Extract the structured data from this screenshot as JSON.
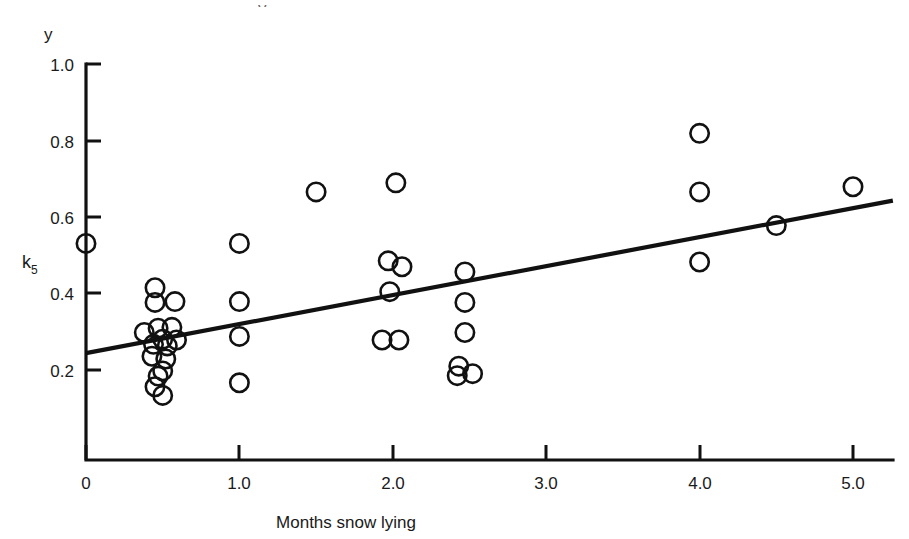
{
  "figure": {
    "background_color": "#ffffff",
    "ink_color": "#111111",
    "partial_glyph_top": "y"
  },
  "chart_data": {
    "type": "scatter",
    "title": "",
    "xlabel": "Months snow lying",
    "ylabel": "y",
    "y_axis_secondary_label": "k",
    "y_axis_secondary_subscript": "5",
    "y_axis_secondary_value": 0.5,
    "xlim": [
      0,
      5.35
    ],
    "ylim": [
      0,
      1.0
    ],
    "grid": false,
    "legend": null,
    "xticks": [
      0,
      1.0,
      2.0,
      3.0,
      4.0,
      5.0
    ],
    "xtick_labels": [
      "0",
      "1.0",
      "2.0",
      "3.0",
      "4.0",
      "5.0"
    ],
    "yticks": [
      0.2,
      0.4,
      0.6,
      0.8,
      1.0
    ],
    "ytick_labels": [
      "0.2",
      "0.4",
      "0.6",
      "0.8",
      "1.0"
    ],
    "marker": "open-circle",
    "points": [
      {
        "x": 0.0,
        "y": 0.547
      },
      {
        "x": 0.45,
        "y": 0.435
      },
      {
        "x": 0.45,
        "y": 0.398
      },
      {
        "x": 0.58,
        "y": 0.4
      },
      {
        "x": 0.38,
        "y": 0.322
      },
      {
        "x": 0.47,
        "y": 0.333
      },
      {
        "x": 0.56,
        "y": 0.335
      },
      {
        "x": 0.5,
        "y": 0.305
      },
      {
        "x": 0.59,
        "y": 0.303
      },
      {
        "x": 0.44,
        "y": 0.292
      },
      {
        "x": 0.53,
        "y": 0.288
      },
      {
        "x": 0.43,
        "y": 0.262
      },
      {
        "x": 0.52,
        "y": 0.255
      },
      {
        "x": 0.5,
        "y": 0.225
      },
      {
        "x": 0.47,
        "y": 0.212
      },
      {
        "x": 0.45,
        "y": 0.185
      },
      {
        "x": 0.5,
        "y": 0.163
      },
      {
        "x": 1.0,
        "y": 0.547
      },
      {
        "x": 1.0,
        "y": 0.4
      },
      {
        "x": 1.0,
        "y": 0.312
      },
      {
        "x": 1.0,
        "y": 0.195
      },
      {
        "x": 1.5,
        "y": 0.677
      },
      {
        "x": 2.02,
        "y": 0.7
      },
      {
        "x": 1.97,
        "y": 0.503
      },
      {
        "x": 2.06,
        "y": 0.488
      },
      {
        "x": 1.98,
        "y": 0.425
      },
      {
        "x": 1.93,
        "y": 0.303
      },
      {
        "x": 2.04,
        "y": 0.303
      },
      {
        "x": 2.47,
        "y": 0.475
      },
      {
        "x": 2.47,
        "y": 0.398
      },
      {
        "x": 2.47,
        "y": 0.322
      },
      {
        "x": 2.43,
        "y": 0.237
      },
      {
        "x": 2.42,
        "y": 0.213
      },
      {
        "x": 2.52,
        "y": 0.218
      },
      {
        "x": 4.0,
        "y": 0.825
      },
      {
        "x": 4.0,
        "y": 0.677
      },
      {
        "x": 4.0,
        "y": 0.5
      },
      {
        "x": 4.5,
        "y": 0.592
      },
      {
        "x": 5.0,
        "y": 0.69
      }
    ],
    "fit_line": {
      "label": "regression line",
      "x_start": 0.0,
      "y_start": 0.27,
      "x_end": 5.26,
      "y_end": 0.655
    }
  }
}
